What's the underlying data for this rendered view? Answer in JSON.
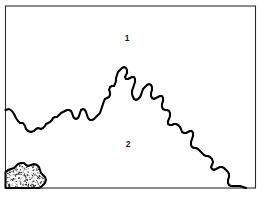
{
  "figure": {
    "background_color": "#ffffff",
    "frame": {
      "x": 5.5,
      "y": 6.0,
      "width": 250.0,
      "height": 182.0,
      "stroke_color": "#2b2b2b",
      "stroke_width": 1.1
    },
    "labels": [
      {
        "text": "1",
        "x": 127,
        "y": 39,
        "region": "upper"
      },
      {
        "text": "2",
        "x": 128,
        "y": 145,
        "region": "lower"
      }
    ],
    "boundary": {
      "name": "irregular-contact-line",
      "stroke_color": "#000000",
      "stroke_width": 2.1,
      "start_point": [
        5.5,
        110
      ],
      "end_point": [
        246,
        188
      ],
      "path": "M 5.5 110 L 9 109 L 12 111 L 14 114 L 16 118 L 18 121 L 20 123 L 23 123 L 25 126 L 26 129 L 28 131 L 31 132 L 34 131 L 36 129 L 38 128 L 41 129 L 43 128 L 45 126 L 46 124 L 48 123 L 50 122 L 52 120 L 53 118 L 55 117 L 57 117 L 59 115 L 61 113 L 63 112 L 65 111 L 67 110 L 69 110 L 71 111 L 72 113 L 73 116 L 74 118 L 76 119 L 78 118 L 79 116 L 80 113 L 81 110 L 83 109 L 85 110 L 86 112 L 87 115 L 88 118 L 90 120 L 92 120 L 94 119 L 96 117 L 98 115 L 100 113 L 101 110 L 102 107 L 103 104 L 104 101 L 105 99 L 107 98 L 109 97 L 110 95 L 110 92 L 109 90 L 110 87 L 112 86 L 114 86 L 115 84 L 116 81 L 116 78 L 117 75 L 118 72 L 120 70 L 122 68 L 124 67 L 126 68 L 127 70 L 127 73 L 126 75 L 125 77 L 126 79 L 128 79 L 130 78 L 132 77 L 134 77 L 135 79 L 135 82 L 134 85 L 133 88 L 132 91 L 132 94 L 133 97 L 134 99 L 136 100 L 138 99 L 140 97 L 141 95 L 142 92 L 143 89 L 145 87 L 147 85 L 149 84 L 151 85 L 152 87 L 152 90 L 151 93 L 151 96 L 152 98 L 154 99 L 156 98 L 158 97 L 160 96 L 162 96 L 163 98 L 163 101 L 162 104 L 162 107 L 163 109 L 165 110 L 167 110 L 169 111 L 170 113 L 170 116 L 169 119 L 168 121 L 168 124 L 170 125 L 172 125 L 174 124 L 176 124 L 178 125 L 180 127 L 181 129 L 182 132 L 184 133 L 186 133 L 188 132 L 190 131 L 192 131 L 193 133 L 193 136 L 192 139 L 191 142 L 191 145 L 192 147 L 194 148 L 196 148 L 198 149 L 200 151 L 202 153 L 204 155 L 206 156 L 208 156 L 210 157 L 212 159 L 213 162 L 212 165 L 211 167 L 212 169 L 214 170 L 216 169 L 218 168 L 220 167 L 222 167 L 224 168 L 226 170 L 228 172 L 229 174 L 229 177 L 228 180 L 228 183 L 229 185 L 231 186 L 234 186 L 237 186 L 240 186 L 243 187 L 246 188"
    },
    "stipple_patch": {
      "name": "stippled-deposit",
      "outline_color": "#000000",
      "fill_color": "#ffffff",
      "dot_color": "#1a1a1a",
      "bounds": [
        5.5,
        160,
        42,
        28
      ],
      "path": "M 5.5 172 L 8 170 L 11 169 L 14 168 L 16 166 L 18 164 L 21 163 L 24 163 L 26 165 L 28 166 L 31 165 L 34 164 L 37 165 L 39 167 L 40 170 L 41 173 L 43 175 L 45 177 L 46 180 L 45 183 L 43 185 L 41 187 L 39 188 L 5.5 188 Z"
    },
    "stipple_dots": {
      "count": 330,
      "radius_min": 0.35,
      "radius_max": 0.75,
      "seed": 1729
    }
  }
}
